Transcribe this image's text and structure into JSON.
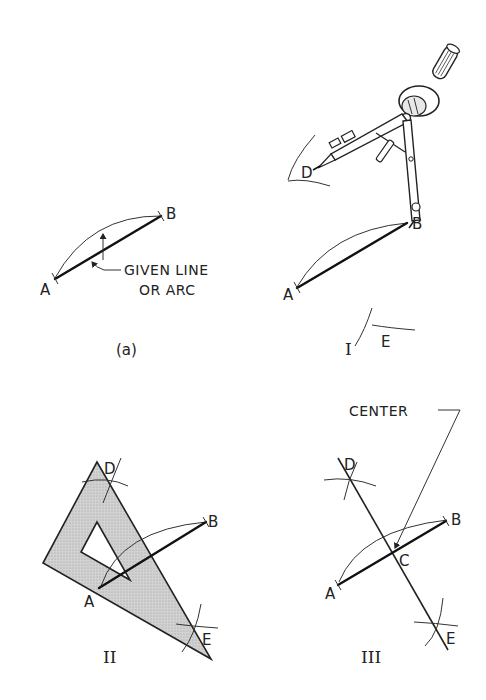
{
  "figure": {
    "panels": [
      {
        "id": "a",
        "caption": "(a)",
        "points": {
          "A": "A",
          "B": "B"
        },
        "annotation": {
          "line1": "GIVEN LINE",
          "line2": "OR ARC"
        }
      },
      {
        "id": "I",
        "caption": "I",
        "points": {
          "A": "A",
          "B": "B",
          "D": "D",
          "E": "E"
        },
        "tool": "compass"
      },
      {
        "id": "II",
        "caption": "II",
        "points": {
          "A": "A",
          "B": "B",
          "D": "D",
          "E": "E"
        },
        "tool": "triangle"
      },
      {
        "id": "III",
        "caption": "III",
        "points": {
          "A": "A",
          "B": "B",
          "C": "C",
          "D": "D",
          "E": "E"
        },
        "annotation": {
          "center": "CENTER"
        }
      }
    ],
    "colors": {
      "ink": "#222222",
      "triangle_fill": "#c8c8c8",
      "background": "#ffffff"
    }
  }
}
